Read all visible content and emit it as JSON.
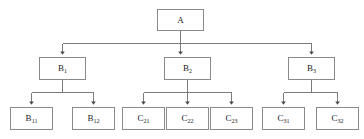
{
  "diagram": {
    "type": "hierarchy-tree",
    "orientation": "top-down",
    "canvas": {
      "width": 364,
      "height": 139
    },
    "style": {
      "box_border_color": "#8a8a8a",
      "box_fill_color": "#ffffff",
      "edge_color": "#6e6e6e",
      "text_color": "#1a1a1a",
      "background_color": "#ffffff",
      "arrowhead": "solid-triangle"
    },
    "levels": [
      {
        "level": 1,
        "nodes": [
          {
            "id": "A",
            "base": "A",
            "sub": "",
            "x": 157,
            "y": 9,
            "w": 47,
            "h": 22
          }
        ]
      },
      {
        "level": 2,
        "nodes": [
          {
            "id": "B1",
            "base": "B",
            "sub": "1",
            "x": 39,
            "y": 57,
            "w": 47,
            "h": 23
          },
          {
            "id": "B2",
            "base": "B",
            "sub": "2",
            "x": 164,
            "y": 57,
            "w": 47,
            "h": 23
          },
          {
            "id": "B3",
            "base": "B",
            "sub": "3",
            "x": 288,
            "y": 57,
            "w": 47,
            "h": 23
          }
        ]
      },
      {
        "level": 3,
        "nodes": [
          {
            "id": "B11",
            "base": "B",
            "sub": "11",
            "x": 10,
            "y": 107,
            "w": 43,
            "h": 23
          },
          {
            "id": "B12",
            "base": "B",
            "sub": "12",
            "x": 72,
            "y": 107,
            "w": 43,
            "h": 23
          },
          {
            "id": "C21",
            "base": "C",
            "sub": "21",
            "x": 122,
            "y": 107,
            "w": 43,
            "h": 23
          },
          {
            "id": "C22",
            "base": "C",
            "sub": "22",
            "x": 166,
            "y": 107,
            "w": 43,
            "h": 23
          },
          {
            "id": "C23",
            "base": "C",
            "sub": "23",
            "x": 210,
            "y": 107,
            "w": 43,
            "h": 23
          },
          {
            "id": "C31",
            "base": "C",
            "sub": "31",
            "x": 262,
            "y": 107,
            "w": 43,
            "h": 23
          },
          {
            "id": "C32",
            "base": "C",
            "sub": "32",
            "x": 316,
            "y": 107,
            "w": 43,
            "h": 23
          }
        ]
      }
    ],
    "edges": [
      {
        "from": "A",
        "to": "B1",
        "name": "edge-a-to-b1"
      },
      {
        "from": "A",
        "to": "B2",
        "name": "edge-a-to-b2"
      },
      {
        "from": "A",
        "to": "B3",
        "name": "edge-a-to-b3"
      },
      {
        "from": "B1",
        "to": "B11",
        "name": "edge-b1-to-b11"
      },
      {
        "from": "B1",
        "to": "B12",
        "name": "edge-b1-to-b12"
      },
      {
        "from": "B2",
        "to": "C21",
        "name": "edge-b2-to-c21"
      },
      {
        "from": "B2",
        "to": "C22",
        "name": "edge-b2-to-c22"
      },
      {
        "from": "B2",
        "to": "C23",
        "name": "edge-b2-to-c23"
      },
      {
        "from": "B3",
        "to": "C31",
        "name": "edge-b3-to-c31"
      },
      {
        "from": "B3",
        "to": "C32",
        "name": "edge-b3-to-c32"
      }
    ]
  }
}
